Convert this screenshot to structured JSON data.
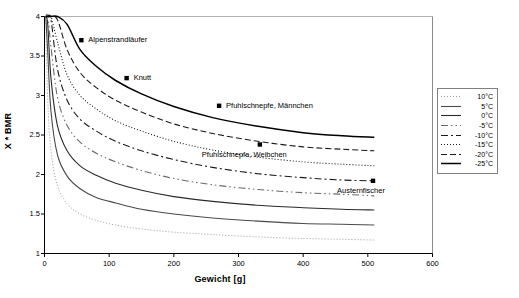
{
  "chart_data": {
    "type": "line",
    "title": "",
    "xlabel": "Gewicht [g]",
    "ylabel": "X * BMR",
    "xlim": [
      0,
      600
    ],
    "ylim": [
      1,
      4
    ],
    "xticks": [
      "0",
      "100",
      "200",
      "300",
      "400",
      "500",
      "600"
    ],
    "yticks": [
      "1",
      "1.5",
      "2",
      "2.5",
      "3",
      "3.5",
      "4"
    ],
    "grid": false,
    "legend_position": "right-outside",
    "series": [
      {
        "name": "10°C",
        "style": "dotted-fine",
        "color": "#9a9a9a",
        "x": [
          2,
          5,
          10,
          20,
          35,
          55,
          80,
          110,
          150,
          200,
          260,
          330,
          400,
          460,
          510
        ],
        "values": [
          3.95,
          2.95,
          2.3,
          1.86,
          1.63,
          1.5,
          1.42,
          1.36,
          1.31,
          1.27,
          1.24,
          1.21,
          1.19,
          1.18,
          1.17
        ]
      },
      {
        "name": "5°C",
        "style": "solid",
        "color": "#4a4a4a",
        "x": [
          2,
          5,
          10,
          20,
          35,
          55,
          80,
          110,
          150,
          200,
          260,
          330,
          400,
          460,
          510
        ],
        "values": [
          4.0,
          3.55,
          2.8,
          2.25,
          1.98,
          1.82,
          1.71,
          1.64,
          1.56,
          1.5,
          1.45,
          1.41,
          1.38,
          1.37,
          1.36
        ]
      },
      {
        "name": "0°C",
        "style": "solid",
        "color": "#2a2a2a",
        "x": [
          2,
          5,
          10,
          20,
          35,
          55,
          80,
          110,
          150,
          200,
          260,
          330,
          400,
          460,
          510
        ],
        "values": [
          4.0,
          3.9,
          3.22,
          2.62,
          2.3,
          2.11,
          1.99,
          1.89,
          1.8,
          1.72,
          1.66,
          1.61,
          1.58,
          1.56,
          1.55
        ]
      },
      {
        "name": "-5°C",
        "style": "dash-dot-dot",
        "color": "#6a6a6a",
        "x": [
          2,
          5,
          10,
          20,
          35,
          55,
          80,
          110,
          150,
          200,
          260,
          330,
          400,
          460,
          510
        ],
        "values": [
          4.0,
          4.0,
          3.62,
          2.98,
          2.62,
          2.41,
          2.27,
          2.16,
          2.05,
          1.95,
          1.87,
          1.81,
          1.77,
          1.75,
          1.73
        ]
      },
      {
        "name": "-10°C",
        "style": "dash-dot",
        "color": "#1a1a1a",
        "x": [
          2,
          5,
          10,
          20,
          35,
          55,
          80,
          110,
          150,
          200,
          260,
          330,
          400,
          460,
          510
        ],
        "values": [
          4.0,
          4.0,
          3.96,
          3.34,
          2.94,
          2.7,
          2.55,
          2.42,
          2.3,
          2.19,
          2.09,
          2.01,
          1.96,
          1.93,
          1.92
        ]
      },
      {
        "name": "-15°C",
        "style": "dotted",
        "color": "#1a1a1a",
        "x": [
          2,
          5,
          10,
          20,
          35,
          55,
          80,
          110,
          150,
          200,
          260,
          330,
          400,
          460,
          510
        ],
        "values": [
          4.0,
          4.0,
          4.0,
          3.68,
          3.26,
          3.0,
          2.83,
          2.68,
          2.55,
          2.42,
          2.31,
          2.22,
          2.16,
          2.13,
          2.11
        ]
      },
      {
        "name": "-20°C",
        "style": "dashed",
        "color": "#1a1a1a",
        "x": [
          2,
          5,
          10,
          20,
          35,
          55,
          80,
          110,
          150,
          200,
          260,
          330,
          400,
          460,
          510
        ],
        "values": [
          4.0,
          4.0,
          4.0,
          3.96,
          3.58,
          3.29,
          3.1,
          2.94,
          2.79,
          2.64,
          2.52,
          2.42,
          2.35,
          2.32,
          2.3
        ]
      },
      {
        "name": "-25°C",
        "style": "solid-bold",
        "color": "#000000",
        "x": [
          2,
          5,
          10,
          20,
          35,
          55,
          80,
          110,
          150,
          200,
          260,
          330,
          400,
          460,
          510
        ],
        "values": [
          4.0,
          4.0,
          4.0,
          4.0,
          3.9,
          3.58,
          3.37,
          3.19,
          3.02,
          2.86,
          2.72,
          2.61,
          2.53,
          2.49,
          2.47
        ]
      }
    ],
    "points": [
      {
        "label": "Alpenstrandläufer",
        "x": 57,
        "y": 3.7,
        "label_side": "right"
      },
      {
        "label": "Knutt",
        "x": 127,
        "y": 3.22,
        "label_side": "right"
      },
      {
        "label": "Pfuhlschnepfe, Männchen",
        "x": 270,
        "y": 2.87,
        "label_side": "right"
      },
      {
        "label": "Pfuhlschnepfe, Weibchen",
        "x": 333,
        "y": 2.38,
        "label_side": "below"
      },
      {
        "label": "Austernfischer",
        "x": 508,
        "y": 1.92,
        "label_side": "below-left"
      }
    ]
  },
  "axes": {
    "x_title": "Gewicht [g]",
    "y_title": "X * BMR",
    "x_tick_labels": [
      "0",
      "100",
      "200",
      "300",
      "400",
      "500",
      "600"
    ],
    "y_tick_labels": [
      "4",
      "3.5",
      "3",
      "2.5",
      "2",
      "1.5",
      "1"
    ]
  },
  "legend": {
    "entries": [
      {
        "label": "10°C"
      },
      {
        "label": "5°C"
      },
      {
        "label": "0°C"
      },
      {
        "label": "-5°C"
      },
      {
        "label": "-10°C"
      },
      {
        "label": "-15°C"
      },
      {
        "label": "-20°C"
      },
      {
        "label": "-25°C"
      }
    ]
  },
  "point_labels": {
    "p0": "Alpenstrandläufer",
    "p1": "Knutt",
    "p2": "Pfuhlschnepfe, Männchen",
    "p3": "Pfuhlschnepfe, Weibchen",
    "p4": "Austernfischer"
  }
}
